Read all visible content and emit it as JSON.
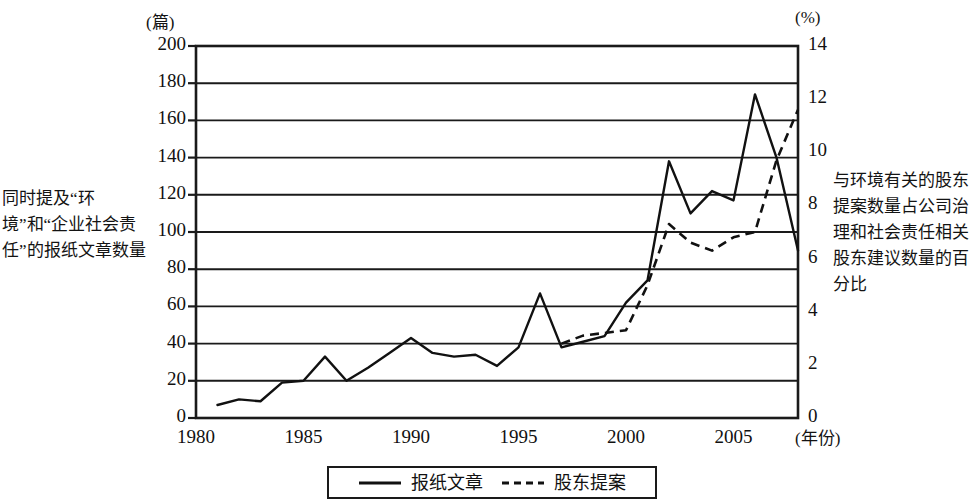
{
  "chart_data": {
    "type": "line",
    "title": "",
    "xlabel": "(年份)",
    "ylabel": "(篇)",
    "y2label": "(%)",
    "grid": true,
    "legend_position": "bottom",
    "xlim": [
      1980,
      2008
    ],
    "ylim": [
      0,
      200
    ],
    "y2lim": [
      0,
      14
    ],
    "xticks": [
      "1980",
      "1985",
      "1990",
      "1995",
      "2000",
      "2005"
    ],
    "xtick_values": [
      1980,
      1985,
      1990,
      1995,
      2000,
      2005
    ],
    "yticks": [
      "0",
      "20",
      "40",
      "60",
      "80",
      "100",
      "120",
      "140",
      "160",
      "180",
      "200"
    ],
    "ytick_values": [
      0,
      20,
      40,
      60,
      80,
      100,
      120,
      140,
      160,
      180,
      200
    ],
    "y2ticks": [
      "0",
      "2",
      "4",
      "6",
      "8",
      "10",
      "12",
      "14"
    ],
    "y2tick_values": [
      0,
      2,
      4,
      6,
      8,
      10,
      12,
      14
    ],
    "series": [
      {
        "name": "报纸文章",
        "style": "solid",
        "axis": "left",
        "color": "#111111",
        "x": [
          1981,
          1982,
          1983,
          1984,
          1985,
          1986,
          1987,
          1988,
          1989,
          1990,
          1991,
          1992,
          1993,
          1994,
          1995,
          1996,
          1997,
          1998,
          1999,
          2000,
          2001,
          2002,
          2003,
          2004,
          2005,
          2006,
          2007,
          2008
        ],
        "values": [
          7,
          10,
          9,
          19,
          20,
          33,
          20,
          27,
          35,
          43,
          35,
          33,
          34,
          28,
          38,
          67,
          38,
          41,
          44,
          62,
          74,
          138,
          110,
          122,
          117,
          174,
          140,
          90
        ]
      },
      {
        "name": "股东提案",
        "style": "dashed",
        "axis": "right",
        "color": "#111111",
        "x": [
          1997,
          1998,
          1999,
          2000,
          2001,
          2002,
          2003,
          2004,
          2005,
          2006,
          2007,
          2008
        ],
        "values": [
          2.8,
          3.1,
          3.2,
          3.3,
          5.0,
          7.3,
          6.6,
          6.3,
          6.8,
          7.0,
          9.7,
          11.6
        ]
      }
    ]
  },
  "captions": {
    "left": "同时提及“环境”和“企业社会责任”的报纸文章数量",
    "right": "与环境有关的股东提案数量占公司治理和社会责任相关股东建议数量的百分比"
  },
  "legend": {
    "items": [
      {
        "label": "报纸文章",
        "style": "solid"
      },
      {
        "label": "股东提案",
        "style": "dashed"
      }
    ]
  }
}
